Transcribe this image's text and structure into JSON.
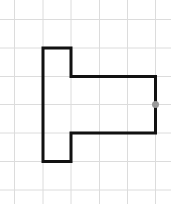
{
  "diagram": {
    "type": "grid-shape",
    "grid": {
      "color": "#dcdcdc",
      "vertical_lines_x": [
        14.5,
        43,
        71,
        99.5,
        127.5,
        155.5
      ],
      "horizontal_lines_y": [
        19.5,
        48,
        76.5,
        104.5,
        133,
        161.5,
        190
      ]
    },
    "shape": {
      "stroke": "#111111",
      "stroke_width": 3,
      "points": "43,48 71,48 71,76.5 155.5,76.5 155.5,133 71,133 71,161.5 43,161.5"
    },
    "marker": {
      "cx": 155.5,
      "cy": 104.5,
      "r": 3.5,
      "color": "#999999"
    }
  }
}
